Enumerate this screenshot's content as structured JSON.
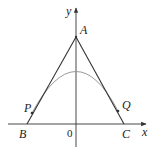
{
  "diagram": {
    "type": "coordinate-geometry",
    "axes": {
      "x_label": "x",
      "y_label": "y",
      "origin_label": "0"
    },
    "points": {
      "A": {
        "label": "A"
      },
      "B": {
        "label": "B"
      },
      "C": {
        "label": "C"
      },
      "P": {
        "label": "P"
      },
      "Q": {
        "label": "Q"
      }
    },
    "colors": {
      "lines": "#333333",
      "curve": "#999999",
      "background": "#ffffff"
    }
  }
}
